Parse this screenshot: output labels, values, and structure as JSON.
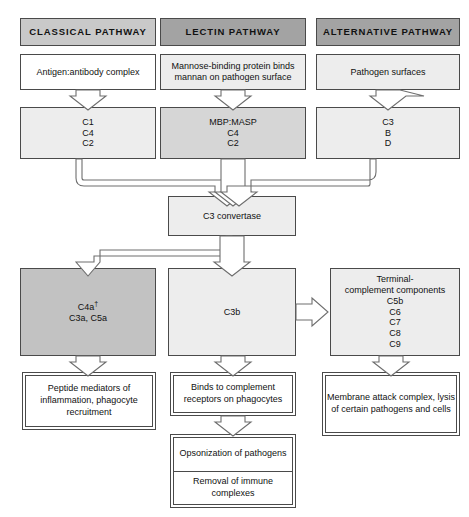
{
  "diagram": {
    "colors": {
      "header_light": "#c9c9c9",
      "header_dark": "#a3a3a3",
      "fill_white": "#ffffff",
      "fill_light": "#ededed",
      "fill_mid": "#d6d6d6",
      "fill_dark": "#c2c2c2",
      "stroke": "#4a4a4a",
      "arrow_fill": "#ffffff",
      "arrow_stroke": "#6e6e6e"
    },
    "columns": [
      {
        "id": "classical",
        "header": "CLASSICAL PATHWAY",
        "trigger": "Antigen:antibody complex",
        "components": [
          "C1",
          "C4",
          "C2"
        ]
      },
      {
        "id": "lectin",
        "header": "LECTIN PATHWAY",
        "trigger": "Mannose-binding protein binds mannan on pathogen surface",
        "components": [
          "MBP:MASP",
          "C4",
          "C2"
        ]
      },
      {
        "id": "alternative",
        "header": "ALTERNATIVE PATHWAY",
        "trigger": "Pathogen surfaces",
        "components": [
          "C3",
          "B",
          "D"
        ]
      }
    ],
    "convertase": "C3 convertase",
    "effectors": {
      "anaphylatoxins": {
        "line1": "C4a",
        "line1_sup": "†",
        "line2": "C3a, C5a"
      },
      "c3b": "C3b",
      "terminal": {
        "title_line1": "Terminal-",
        "title_line2": "complement components",
        "components": [
          "C5b",
          "C6",
          "C7",
          "C8",
          "C9"
        ]
      }
    },
    "outcomes": {
      "left": "Peptide mediators of inflammation, phagocyte recruitment",
      "middle_top": "Binds to complement receptors on phagocytes",
      "middle_bottom_1": "Opsonization of pathogens",
      "middle_bottom_2": "Removal of immune complexes",
      "right": "Membrane attack complex, lysis of certain pathogens and cells"
    }
  }
}
